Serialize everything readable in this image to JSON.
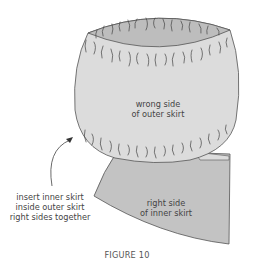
{
  "figure": {
    "caption": "FIGURE 10",
    "colors": {
      "outer_skirt_fill": "#dcdcdc",
      "outer_opening_fill": "#bdbdbd",
      "inner_skirt_fill": "#c3c3c3",
      "outline": "#555555",
      "gather_marks": "#444444",
      "text": "#444444"
    },
    "labels": {
      "outer_skirt": {
        "line1": "wrong side",
        "line2": "of outer skirt"
      },
      "inner_skirt": {
        "line1": "right side",
        "line2": "of inner skirt"
      },
      "instruction": {
        "line1": "insert inner skirt",
        "line2": "inside outer skirt",
        "line3": "right sides together"
      }
    },
    "arrow": {
      "direction": "up-right",
      "target": "outer-skirt"
    }
  }
}
